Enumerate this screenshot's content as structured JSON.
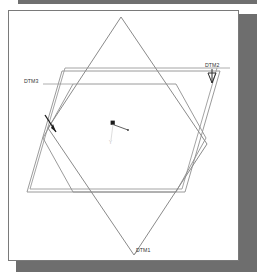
{
  "window": {
    "name": "cad-graphics-window",
    "background_color": "#ffffff",
    "border_color": "#7a7a7a",
    "shadow_color": "#6e6e6e",
    "top_strip_color": "#6f6f6f"
  },
  "drawing": {
    "type": "3d-datum-plane-wireframe",
    "description": "Three intersecting datum planes shown in an isometric wireframe view with a coordinate system marker at the centre.",
    "line_color": "#8a8a8a",
    "accent_color": "#2b2b2b",
    "datums": [
      {
        "id": "DTM1",
        "label": "DTM1",
        "shape": "diamond",
        "label_x": 133,
        "label_y": 247,
        "leader": "below-bottom-vertex",
        "points": "112,6 195,132 122,245 42,117",
        "color": "#8a8a8a",
        "double_outline": false
      },
      {
        "id": "DTM2",
        "label": "DTM2",
        "shape": "parallelogram",
        "label_x": 196,
        "label_y": 58,
        "leader": "left-to-top-right-corner",
        "points": "56,57 208,57 173,178 21,178",
        "outer_points": "53,60 211,60 176,181 18,181",
        "color": "#8a8a8a",
        "double_outline": true
      },
      {
        "id": "DTM3",
        "label": "DTM3",
        "shape": "hexagon",
        "label_x": 16,
        "label_y": 73,
        "leader": "right-to-top-left-vertex",
        "points": "18,73 64,73 100,105 94,164 48,164 12,132",
        "color": "#8a8a8a",
        "double_outline": false
      }
    ],
    "coordinate_system": {
      "name": "csys-marker",
      "origin_x": 104,
      "origin_y": 112,
      "x_axis_label": "X",
      "y_axis_label": "Y",
      "marker_color": "#1c1c1c"
    },
    "flip_arrow": {
      "name": "plane-direction-arrow",
      "x": 44,
      "y": 113,
      "color": "#1c1c1c"
    },
    "drag_handle": {
      "name": "plane-drag-handle",
      "x": 204,
      "y": 64,
      "color": "#2b2b2b"
    }
  }
}
